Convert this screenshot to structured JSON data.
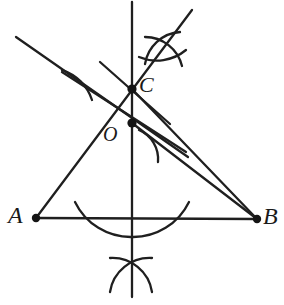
{
  "figure": {
    "width": 284,
    "height": 305,
    "background_color": "#ffffff",
    "stroke_color": "#1f1f1f",
    "point_color": "#141414"
  },
  "labels": {
    "a": "A",
    "b": "B",
    "c": "C",
    "o": "O"
  },
  "points": [
    {
      "name": "A",
      "label": "A",
      "x": 36,
      "y": 218,
      "radius": 4.2
    },
    {
      "name": "B",
      "label": "B",
      "x": 257,
      "y": 219,
      "radius": 4.2
    },
    {
      "name": "C",
      "label": "C",
      "x": 132,
      "y": 89,
      "radius": 4.6
    },
    {
      "name": "O",
      "label": "O",
      "x": 132,
      "y": 123,
      "radius": 4.6
    }
  ],
  "segments": [
    {
      "name": "side-ab",
      "x1": 36,
      "y1": 218,
      "x2": 257,
      "y2": 219,
      "width": 2.3
    },
    {
      "name": "line-a-through-c",
      "x1": 36,
      "y1": 218,
      "x2": 192,
      "y2": 10,
      "width": 2.3
    },
    {
      "name": "line-c-to-b",
      "x1": 132,
      "y1": 89,
      "x2": 257,
      "y2": 219,
      "width": 2.3
    },
    {
      "name": "line-o-to-b",
      "x1": 132,
      "y1": 123,
      "x2": 257,
      "y2": 219,
      "width": 2.3
    },
    {
      "name": "perpendicular-bisector-ab",
      "x1": 132,
      "y1": 2,
      "x2": 132,
      "y2": 297,
      "width": 2.3
    },
    {
      "name": "transversal-upper-left",
      "x1": 16,
      "y1": 37,
      "x2": 188,
      "y2": 157,
      "width": 2.3
    },
    {
      "name": "ray-upper-left-short",
      "x1": 62,
      "y1": 72,
      "x2": 186,
      "y2": 152,
      "width": 2.3
    },
    {
      "name": "ray-through-c-upper",
      "x1": 100,
      "y1": 62,
      "x2": 170,
      "y2": 124,
      "width": 2.3
    }
  ],
  "arcs": [
    {
      "name": "arc-below-ab-left",
      "d": "M 75,202 A 62,62 0 0 0 132,237",
      "width": 2.3
    },
    {
      "name": "arc-below-ab-right",
      "d": "M 132,237 A 62,62 0 0 0 189,202",
      "width": 2.3
    },
    {
      "name": "arc-bottom-cross-left",
      "d": "M 110,258 A 40,40 0 0 1 152,292",
      "width": 2.3
    },
    {
      "name": "arc-bottom-cross-right",
      "d": "M 152,258 A 40,40 0 0 0 110,292",
      "width": 2.3
    },
    {
      "name": "arc-top-cross-left",
      "d": "M 145,37 A 38,38 0 0 1 182,66",
      "width": 2.3
    },
    {
      "name": "arc-top-cross-right",
      "d": "M 180,32 A 38,38 0 0 0 145,64",
      "width": 2.3
    },
    {
      "name": "arc-top-cross-flat",
      "d": "M 139,57 A 46,46 0 0 0 186,50",
      "width": 2.3
    },
    {
      "name": "arc-near-o",
      "d": "M 139,130 A 32,32 0 0 1 158,162",
      "width": 2.3
    },
    {
      "name": "arc-near-upper-left",
      "d": "M 62,70 A 46,46 0 0 1 92,100",
      "width": 2.3
    }
  ],
  "construction_notes": {
    "type": "compass-and-straightedge",
    "base_segment": "AB",
    "apex": "C",
    "interior_point": "O"
  }
}
